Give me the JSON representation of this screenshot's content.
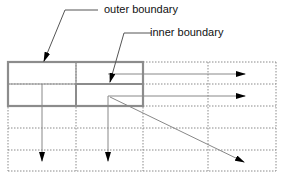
{
  "diagram": {
    "labels": {
      "outer": "outer boundary",
      "inner": "inner boundary"
    },
    "grid": {
      "columns_x": [
        8,
        76,
        143,
        208,
        276
      ],
      "rows_y": [
        62,
        84,
        106,
        128,
        150,
        171
      ],
      "line_style": "dotted",
      "color": "#8a8a8a"
    },
    "outer_boundary": {
      "x": 8,
      "y": 62,
      "w": 135,
      "h": 44,
      "color": "#8c8c8c"
    },
    "inner_boundary": {
      "x": 76,
      "y": 84,
      "w": 67,
      "h": 22,
      "color": "#8c8c8c"
    },
    "arrows": [
      {
        "name": "horizontal-arrow-row1",
        "from": [
          108,
          74
        ],
        "to": [
          245,
          74
        ]
      },
      {
        "name": "horizontal-arrow-row2",
        "from": [
          108,
          96
        ],
        "to": [
          245,
          96
        ]
      },
      {
        "name": "down-arrow-col1",
        "from": [
          42,
          84
        ],
        "to": [
          42,
          160
        ]
      },
      {
        "name": "down-arrow-col2",
        "from": [
          108,
          96
        ],
        "to": [
          108,
          160
        ]
      },
      {
        "name": "diagonal-arrow",
        "from": [
          108,
          96
        ],
        "to": [
          244,
          162
        ]
      }
    ]
  }
}
